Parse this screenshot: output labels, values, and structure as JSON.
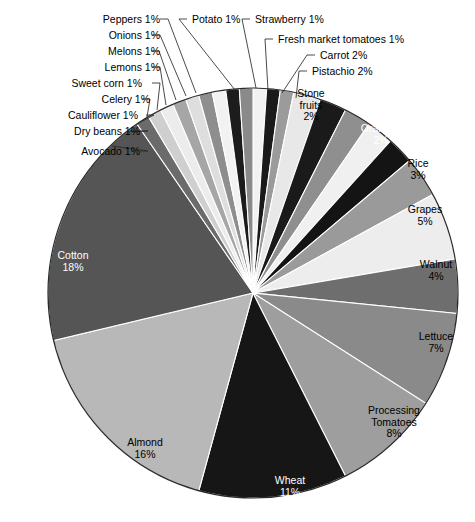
{
  "chart_data": {
    "type": "pie",
    "title": "",
    "legend_position": "callout-labels",
    "grid": false,
    "units": "percent",
    "start_angle_deg": -90,
    "direction": "clockwise",
    "categories": [
      "Potato",
      "Strawberry",
      "Fresh market tomatoes",
      "Carrot",
      "Pistachio",
      "Stone fruits",
      "Oranges",
      "Rice",
      "Grapes",
      "Walnut",
      "Lettuce",
      "Processing Tomatoes",
      "Wheat",
      "Almond",
      "Cotton",
      "Avocado",
      "Dry beans",
      "Cauliflower",
      "Celery",
      "Sweet corn",
      "Lemons",
      "Melons",
      "Onions",
      "Peppers"
    ],
    "values": [
      1,
      1,
      1,
      2,
      2,
      2,
      2,
      3,
      5,
      4,
      7,
      8,
      11,
      16,
      18,
      1,
      1,
      1,
      1,
      1,
      1,
      1,
      1,
      1
    ],
    "slices": [
      {
        "label": "Potato",
        "value": 1,
        "display": "1%",
        "color": "#f2f2f2",
        "label_mode": "callout"
      },
      {
        "label": "Strawberry",
        "value": 1,
        "display": "1%",
        "color": "#1a1a1a",
        "label_mode": "callout"
      },
      {
        "label": "Fresh market tomatoes",
        "value": 1,
        "display": "1%",
        "color": "#9b9b9b",
        "label_mode": "callout"
      },
      {
        "label": "Carrot",
        "value": 2,
        "display": "2%",
        "color": "#e8e8e8",
        "label_mode": "callout"
      },
      {
        "label": "Pistachio",
        "value": 2,
        "display": "2%",
        "color": "#1a1a1a",
        "label_mode": "callout"
      },
      {
        "label": "Stone fruits",
        "value": 2,
        "display": "2%",
        "color": "#8f8f8f",
        "label_mode": "inside",
        "label_color": "dark"
      },
      {
        "label": "Stone fruits",
        "value": 2,
        "display": "2%",
        "color": "#f0f0f0",
        "label_mode": "inside-label",
        "label_color": "dark"
      },
      {
        "label": "Oranges",
        "value": 2,
        "display": "2%",
        "color": "#141414",
        "label_mode": "inside",
        "label_color": "light"
      },
      {
        "label": "Rice",
        "value": 3,
        "display": "3%",
        "color": "#9a9a9a",
        "label_mode": "inside",
        "label_color": "dark"
      },
      {
        "label": "Grapes",
        "value": 5,
        "display": "5%",
        "color": "#ededed",
        "label_mode": "inside",
        "label_color": "dark"
      },
      {
        "label": "Walnut",
        "value": 4,
        "display": "4%",
        "color": "#6e6e6e",
        "label_mode": "inside",
        "label_color": "dark"
      },
      {
        "label": "Lettuce",
        "value": 7,
        "display": "7%",
        "color": "#8a8a8a",
        "label_mode": "inside",
        "label_color": "dark"
      },
      {
        "label": "Processing Tomatoes",
        "value": 8,
        "display": "8%",
        "color": "#9e9e9e",
        "label_mode": "inside",
        "label_color": "dark"
      },
      {
        "label": "Wheat",
        "value": 11,
        "display": "11%",
        "color": "#161616",
        "label_mode": "inside",
        "label_color": "light"
      },
      {
        "label": "Almond",
        "value": 16,
        "display": "16%",
        "color": "#b8b8b8",
        "label_mode": "inside",
        "label_color": "dark"
      },
      {
        "label": "Cotton",
        "value": 18,
        "display": "18%",
        "color": "#555555",
        "label_mode": "inside",
        "label_color": "light"
      },
      {
        "label": "Avocado",
        "value": 1,
        "display": "1%",
        "color": "#6b6b6b",
        "label_mode": "callout"
      },
      {
        "label": "Dry beans",
        "value": 1,
        "display": "1%",
        "color": "#cfcfcf",
        "label_mode": "callout"
      },
      {
        "label": "Cauliflower",
        "value": 1,
        "display": "1%",
        "color": "#ececec",
        "label_mode": "callout"
      },
      {
        "label": "Celery",
        "value": 1,
        "display": "1%",
        "color": "#a6a6a6",
        "label_mode": "callout"
      },
      {
        "label": "Sweet corn",
        "value": 1,
        "display": "1%",
        "color": "#dedede",
        "label_mode": "callout"
      },
      {
        "label": "Lemons",
        "value": 1,
        "display": "1%",
        "color": "#8e8e8e",
        "label_mode": "callout"
      },
      {
        "label": "Melons",
        "value": 1,
        "display": "1%",
        "color": "#f2f2f2",
        "label_mode": "callout"
      },
      {
        "label": "Onions",
        "value": 1,
        "display": "1%",
        "color": "#1c1c1c",
        "label_mode": "callout"
      },
      {
        "label": "Peppers",
        "value": 1,
        "display": "1%",
        "color": "#8a8a8a",
        "label_mode": "callout"
      }
    ]
  },
  "callouts": [
    {
      "name": "peppers",
      "text": "Peppers 1%",
      "x": 104,
      "y": 14,
      "align": "right",
      "tx": 160,
      "ty": 19,
      "ex": 196,
      "ey": 93
    },
    {
      "name": "onions",
      "text": "Onions 1%",
      "x": 104,
      "y": 30,
      "align": "right",
      "tx": 152,
      "ty": 35,
      "ex": 186,
      "ey": 96
    },
    {
      "name": "melons",
      "text": "Melons 1%",
      "x": 104,
      "y": 46,
      "align": "right",
      "tx": 151,
      "ty": 51,
      "ex": 176,
      "ey": 100
    },
    {
      "name": "lemons",
      "text": "Lemons 1%",
      "x": 104,
      "y": 62,
      "align": "right",
      "tx": 152,
      "ty": 67,
      "ex": 166,
      "ey": 105
    },
    {
      "name": "sweetcorn",
      "text": "Sweet corn 1%",
      "x": 86,
      "y": 78,
      "align": "right",
      "tx": 152,
      "ty": 83,
      "ex": 157,
      "ey": 110
    },
    {
      "name": "celery",
      "text": "Celery 1%",
      "x": 94,
      "y": 94,
      "align": "right",
      "tx": 142,
      "ty": 99,
      "ex": 147,
      "ey": 117
    },
    {
      "name": "cauliflwr",
      "text": "Cauliflower 1%",
      "x": 82,
      "y": 110,
      "align": "right",
      "tx": 146,
      "ty": 115,
      "ex": 137,
      "ey": 124
    },
    {
      "name": "drybeans",
      "text": "Dry beans 1%",
      "x": 84,
      "y": 126,
      "align": "right",
      "tx": 140,
      "ty": 131,
      "ex": 127,
      "ey": 132
    },
    {
      "name": "avocado",
      "text": "Avocado 1%",
      "x": 84,
      "y": 146,
      "align": "right",
      "tx": 140,
      "ty": 151,
      "ex": 112,
      "ey": 146
    },
    {
      "name": "potato",
      "text": "Potato 1%",
      "x": 192,
      "y": 14,
      "align": "left",
      "tx": 187,
      "ty": 19,
      "ex": 235,
      "ey": 90
    },
    {
      "name": "strawberry",
      "text": "Strawberry 1%",
      "x": 255,
      "y": 14,
      "align": "left",
      "tx": 250,
      "ty": 19,
      "ex": 256,
      "ey": 88
    },
    {
      "name": "freshtom",
      "text": "Fresh market tomatoes 1%",
      "x": 278,
      "y": 34,
      "align": "left",
      "tx": 273,
      "ty": 39,
      "ex": 268,
      "ey": 90
    },
    {
      "name": "carrot",
      "text": "Carrot 2%",
      "x": 320,
      "y": 50,
      "align": "left",
      "tx": 315,
      "ty": 55,
      "ex": 282,
      "ey": 93
    },
    {
      "name": "pistachio",
      "text": "Pistachio 2%",
      "x": 312,
      "y": 66,
      "align": "left",
      "tx": 307,
      "ty": 71,
      "ex": 296,
      "ey": 98
    }
  ],
  "inside_labels": [
    {
      "name": "stone-fruits",
      "line1": "Stone",
      "line2": "fruits",
      "line3": "2%",
      "x": 281,
      "y": 88,
      "w": 60,
      "tone": "dark"
    },
    {
      "name": "oranges",
      "line1": "Oranges",
      "line2": "2%",
      "line3": "",
      "x": 350,
      "y": 123,
      "w": 62,
      "tone": "light"
    },
    {
      "name": "rice",
      "line1": "Rice",
      "line2": "3%",
      "line3": "",
      "x": 398,
      "y": 158,
      "w": 40,
      "tone": "dark"
    },
    {
      "name": "grapes",
      "line1": "Grapes",
      "line2": "5%",
      "line3": "",
      "x": 399,
      "y": 204,
      "w": 52,
      "tone": "dark"
    },
    {
      "name": "walnut",
      "line1": "Walnut",
      "line2": "4%",
      "line3": "",
      "x": 411,
      "y": 259,
      "w": 50,
      "tone": "dark"
    },
    {
      "name": "lettuce",
      "line1": "Lettuce",
      "line2": "7%",
      "line3": "",
      "x": 410,
      "y": 331,
      "w": 52,
      "tone": "dark"
    },
    {
      "name": "proc-tomato",
      "line1": "Processing",
      "line2": "Tomatoes",
      "line3": "8%",
      "x": 357,
      "y": 405,
      "w": 74,
      "tone": "dark"
    },
    {
      "name": "wheat",
      "line1": "Wheat",
      "line2": "11%",
      "line3": "",
      "x": 267,
      "y": 475,
      "w": 46,
      "tone": "light"
    },
    {
      "name": "almond",
      "line1": "Almond",
      "line2": "16%",
      "line3": "",
      "x": 119,
      "y": 437,
      "w": 52,
      "tone": "dark"
    },
    {
      "name": "cotton",
      "line1": "Cotton",
      "line2": "18%",
      "line3": "",
      "x": 48,
      "y": 250,
      "w": 50,
      "tone": "light"
    }
  ],
  "geometry": {
    "cx": 253,
    "cy": 293,
    "r": 205,
    "stroke": "#ffffff",
    "stroke_width": 1.1
  }
}
